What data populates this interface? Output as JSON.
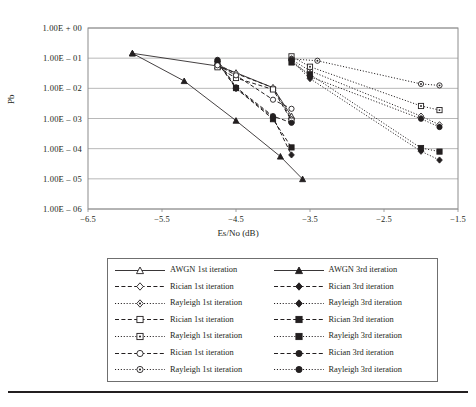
{
  "chart_data": {
    "type": "line",
    "title": "",
    "xlabel": "Es/No (dB)",
    "ylabel": "Pb",
    "xlim": [
      -6.5,
      -1.5
    ],
    "ylim": [
      1e-06,
      1.0
    ],
    "yscale": "log",
    "grid": true,
    "legend_position": "below",
    "xticks": [
      -6.5,
      -5.5,
      -4.5,
      -3.5,
      -2.5,
      -1.5
    ],
    "xticklabels": [
      "−6.5",
      "−5.5",
      "−4.5",
      "−3.5",
      "−2.5",
      "−1.5"
    ],
    "yticks": [
      1.0,
      0.1,
      0.01,
      0.001,
      0.0001,
      1e-05,
      1e-06
    ],
    "yticklabels": [
      "1.00E + 00",
      "1.00E – 01",
      "1.00E – 02",
      "1.00E – 03",
      "1.00E – 04",
      "1.00E – 05",
      "1.00E – 06"
    ],
    "series": [
      {
        "name": "AWGN 1st iteration",
        "marker": "triangle-open",
        "fill": false,
        "dash": "solid",
        "x": [
          -5.9,
          -4.75,
          -4.5,
          -4.0,
          -3.75
        ],
        "y": [
          0.145,
          0.055,
          0.033,
          0.0105,
          0.0012
        ]
      },
      {
        "name": "AWGN 3rd iteration",
        "marker": "triangle-filled",
        "fill": true,
        "dash": "solid",
        "x": [
          -5.9,
          -5.2,
          -4.5,
          -3.9,
          -3.6
        ],
        "y": [
          0.145,
          0.0175,
          0.00085,
          5.5e-05,
          9.8e-06
        ]
      },
      {
        "name": "Rician 1st iteration",
        "marker": "diamond-open",
        "fill": false,
        "dash": "dashed",
        "x": [
          -4.75,
          -4.5,
          -4.0,
          -3.75
        ],
        "y": [
          0.062,
          0.031,
          0.0105,
          0.00095
        ]
      },
      {
        "name": "Rician 3rd iteration",
        "marker": "diamond-filled",
        "fill": true,
        "dash": "dashed",
        "x": [
          -4.75,
          -4.5,
          -4.0,
          -3.75
        ],
        "y": [
          0.078,
          0.0098,
          0.0011,
          6.2e-05
        ]
      },
      {
        "name": "Rayleigh 1st iteration",
        "marker": "diamond-open-dot",
        "fill": false,
        "dash": "dotted",
        "x": [
          -3.75,
          -3.5,
          -2.0,
          -1.75
        ],
        "y": [
          0.09,
          0.038,
          0.0012,
          0.00062
        ]
      },
      {
        "name": "Rayleigh 3rd iteration",
        "marker": "diamond-filled",
        "fill": true,
        "dash": "dotted",
        "x": [
          -3.75,
          -3.5,
          -2.0,
          -1.75
        ],
        "y": [
          0.082,
          0.021,
          8.2e-05,
          4.2e-05
        ]
      },
      {
        "name": "Rician 1st iteration",
        "marker": "square-open",
        "fill": false,
        "dash": "dashed",
        "x": [
          -4.75,
          -4.5,
          -4.0,
          -3.75
        ],
        "y": [
          0.05,
          0.022,
          0.0092,
          0.00085
        ]
      },
      {
        "name": "Rician 3rd iteration",
        "marker": "square-filled",
        "fill": true,
        "dash": "dashed",
        "x": [
          -4.75,
          -4.5,
          -4.0,
          -3.75
        ],
        "y": [
          0.072,
          0.0102,
          0.00095,
          0.00011
        ]
      },
      {
        "name": "Rayleigh 1st iteration",
        "marker": "square-open-dot",
        "fill": false,
        "dash": "dotted",
        "x": [
          -3.75,
          -3.5,
          -2.0,
          -1.75
        ],
        "y": [
          0.115,
          0.052,
          0.0026,
          0.0019
        ]
      },
      {
        "name": "Rayleigh 3rd iteration",
        "marker": "square-filled",
        "fill": true,
        "dash": "dotted",
        "x": [
          -3.75,
          -3.5,
          -2.0,
          -1.75
        ],
        "y": [
          0.072,
          0.029,
          0.000105,
          8e-05
        ]
      },
      {
        "name": "Rician 1st iteration",
        "marker": "circle-open",
        "fill": false,
        "dash": "dashed",
        "x": [
          -4.75,
          -4.5,
          -4.0,
          -3.75
        ],
        "y": [
          0.058,
          0.027,
          0.0042,
          0.0021
        ]
      },
      {
        "name": "Rician 3rd iteration",
        "marker": "circle-filled",
        "fill": true,
        "dash": "dashed",
        "x": [
          -4.75,
          -4.5,
          -4.0,
          -3.75
        ],
        "y": [
          0.088,
          0.0108,
          0.0012,
          0.00072
        ]
      },
      {
        "name": "Rayleigh 1st iteration",
        "marker": "circle-open-dot",
        "fill": false,
        "dash": "dotted",
        "x": [
          -3.75,
          -3.4,
          -2.0,
          -1.75
        ],
        "y": [
          0.095,
          0.082,
          0.014,
          0.0125
        ]
      },
      {
        "name": "Rayleigh 3rd iteration",
        "marker": "circle-filled",
        "fill": true,
        "dash": "dotted",
        "x": [
          -3.75,
          -3.5,
          -2.0,
          -1.75
        ],
        "y": [
          0.088,
          0.0245,
          0.00098,
          0.00052
        ]
      }
    ]
  },
  "axes": {
    "y_title": "Pb",
    "x_title": "Es/No (dB)"
  },
  "legend": {
    "rows": [
      {
        "left": "AWGN 1st iteration",
        "left_marker": "triangle-open",
        "left_dash": "solid",
        "right": "AWGN 3rd iteration",
        "right_marker": "triangle-filled",
        "right_dash": "solid"
      },
      {
        "left": "Rician 1st iteration",
        "left_marker": "diamond-open",
        "left_dash": "dashed",
        "right": "Rician 3rd iteration",
        "right_marker": "diamond-filled",
        "right_dash": "dashed"
      },
      {
        "left": "Rayleigh 1st iteration",
        "left_marker": "diamond-open-dot",
        "left_dash": "dotted",
        "right": "Rayleigh 3rd iteration",
        "right_marker": "diamond-filled",
        "right_dash": "dotted"
      },
      {
        "left": "Rician 1st iteration",
        "left_marker": "square-open",
        "left_dash": "dashed",
        "right": "Rician 3rd iteration",
        "right_marker": "square-filled",
        "right_dash": "dashed"
      },
      {
        "left": "Rayleigh 1st iteration",
        "left_marker": "square-open-dot",
        "left_dash": "dotted",
        "right": "Rayleigh 3rd iteration",
        "right_marker": "square-filled",
        "right_dash": "dotted"
      },
      {
        "left": "Rician 1st iteration",
        "left_marker": "circle-open",
        "left_dash": "dashed",
        "right": "Rician 3rd iteration",
        "right_marker": "circle-filled",
        "right_dash": "dashed"
      },
      {
        "left": "Rayleigh 1st iteration",
        "left_marker": "circle-open-dot",
        "left_dash": "dotted",
        "right": "Rayleigh 3rd iteration",
        "right_marker": "circle-filled",
        "right_dash": "dotted"
      }
    ]
  },
  "colors": {
    "ink": "#231f20",
    "grid": "#a6a6a6",
    "frame": "#8c8c8c",
    "rule": "#231f20"
  }
}
